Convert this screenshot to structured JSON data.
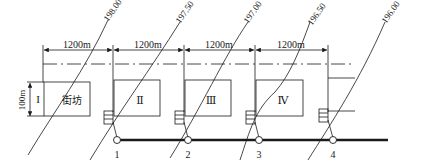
{
  "diagram": {
    "dimension_label": "1200m",
    "dimensions": [
      "1200m",
      "1200m",
      "1200m",
      "1200m"
    ],
    "block_height_label": "100m",
    "blocks": [
      {
        "id": "I",
        "label": "I",
        "inner_label": "街坊"
      },
      {
        "id": "II",
        "label": "Ⅱ"
      },
      {
        "id": "III",
        "label": "Ⅲ"
      },
      {
        "id": "IV",
        "label": "Ⅳ"
      }
    ],
    "contours": [
      "198.00",
      "197.50",
      "197.00",
      "196.50",
      "196.00"
    ],
    "nodes": [
      "1",
      "2",
      "3",
      "4"
    ],
    "colors": {
      "line": "#1a1a1a",
      "background": "#ffffff"
    }
  }
}
